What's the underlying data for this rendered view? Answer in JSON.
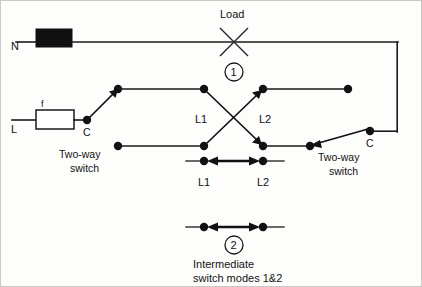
{
  "diagram": {
    "ink_color": "#111111",
    "background_color": "#fdfdfc",
    "labels": {
      "neutral": "N",
      "live": "L",
      "fuse": "f",
      "load": "Load",
      "common_left": "C",
      "common_right": "C",
      "l1_top": "L1",
      "l2_top": "L2",
      "l1_bottom": "L1",
      "l2_bottom": "L2",
      "two_way_switch_left_line1": "Two-way",
      "two_way_switch_left_line2": "switch",
      "two_way_switch_right_line1": "Two-way",
      "two_way_switch_right_line2": "switch",
      "mode_1_number": "1",
      "mode_2_number": "2",
      "caption_line1": "Intermediate",
      "caption_line2": "switch modes 1&2"
    }
  }
}
